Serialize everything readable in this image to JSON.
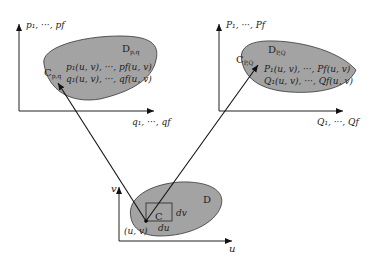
{
  "diagram": {
    "left_space": {
      "y_axis_label": "p₁, ···, pf",
      "x_axis_label": "q₁, ···, qf",
      "region_label": "D",
      "region_sub": "p,q",
      "curve_label": "C",
      "curve_sub": "p,q",
      "formula_line1": "p₁(u, v), ···, pf(u, v)",
      "formula_line2": "q₁(u, v), ···, qf(u, v)"
    },
    "right_space": {
      "y_axis_label": "P₁, ···, Pf",
      "x_axis_label": "Q₁, ···, Qf",
      "region_label": "D",
      "region_sub": "P,Q",
      "curve_label": "C",
      "curve_sub": "P,Q",
      "formula_line1": "P₁(u, v), ···, Pf(u, v)",
      "formula_line2": "Q₁(u, v), ···, Qf(u, v)"
    },
    "parameter_space": {
      "y_axis_label": "v",
      "x_axis_label": "u",
      "region_label": "D",
      "cell_label": "C",
      "dv_label": "dv",
      "du_label": "du",
      "point_label": "(u, v)"
    }
  }
}
